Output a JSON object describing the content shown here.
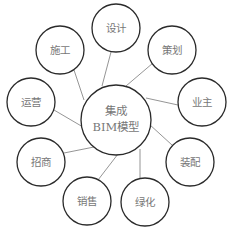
{
  "diagram": {
    "type": "hub-and-spoke",
    "center": {
      "line1": "集成",
      "line2": "BIM模型"
    },
    "nodes": [
      {
        "id": "design",
        "label": "设计"
      },
      {
        "id": "planning",
        "label": "策划"
      },
      {
        "id": "owner",
        "label": "业主"
      },
      {
        "id": "assembly",
        "label": "装配"
      },
      {
        "id": "greening",
        "label": "绿化"
      },
      {
        "id": "sales",
        "label": "销售"
      },
      {
        "id": "investment",
        "label": "招商"
      },
      {
        "id": "operation",
        "label": "运营"
      },
      {
        "id": "construction",
        "label": "施工"
      }
    ],
    "colors": {
      "stroke": "#2a2a2a",
      "edge": "#7a7a7a",
      "text": "#777777"
    }
  }
}
